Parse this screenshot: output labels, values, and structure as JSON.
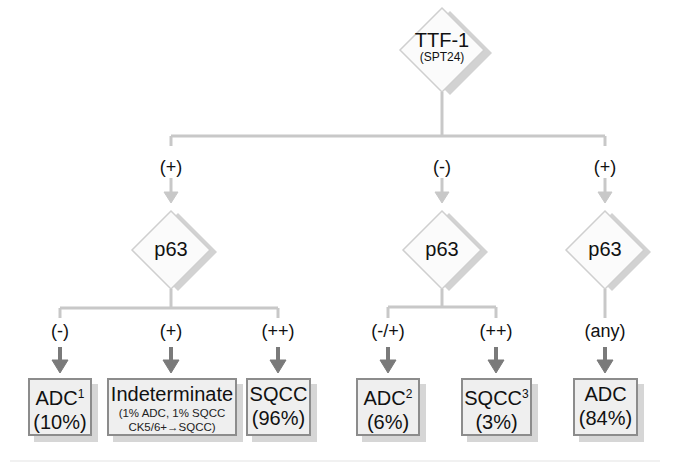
{
  "root": {
    "title": "TTF-1",
    "subtitle": "(SPT24)"
  },
  "branches": [
    {
      "edge_label": "(+)",
      "node": "p63",
      "children": [
        {
          "edge_label": "(-)",
          "result": "ADC",
          "sup": "1",
          "percent": "(10%)"
        },
        {
          "edge_label": "(+)",
          "result": "Indeterminate",
          "note_line1": "(1% ADC, 1% SQCC",
          "note_line2": "CK5/6+→SQCC)"
        },
        {
          "edge_label": "(++)",
          "result": "SQCC",
          "percent": "(96%)"
        }
      ]
    },
    {
      "edge_label": "(-)",
      "node": "p63",
      "children": [
        {
          "edge_label": "(-/+)",
          "result": "ADC",
          "sup": "2",
          "percent": "(6%)"
        },
        {
          "edge_label": "(++)",
          "result": "SQCC",
          "sup": "3",
          "percent": "(3%)"
        }
      ]
    },
    {
      "edge_label": "(+)",
      "node": "p63",
      "children": [
        {
          "edge_label": "(any)",
          "result": "ADC",
          "percent": "(84%)"
        }
      ]
    }
  ],
  "colors": {
    "connector": "#c8c8c8",
    "arrow_dark": "#7a7a7a",
    "box_fill": "#efefef",
    "box_border": "#8c8c8c"
  }
}
